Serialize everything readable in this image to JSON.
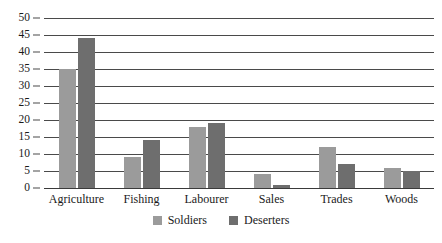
{
  "chart_data": {
    "type": "bar",
    "title": "",
    "subtitle": "",
    "xlabel": "",
    "ylabel": "",
    "categories": [
      "Agriculture",
      "Fishing",
      "Labourer",
      "Sales",
      "Trades",
      "Woods"
    ],
    "series": [
      {
        "name": "Soldiers",
        "color": "#9b9b9b",
        "values": [
          35,
          9,
          18,
          4,
          12,
          6
        ]
      },
      {
        "name": "Deserters",
        "color": "#6e6e6e",
        "values": [
          44,
          14,
          19,
          1,
          7,
          5
        ]
      }
    ],
    "ylim": [
      0,
      50
    ],
    "ytick_step": 5,
    "yticks": [
      "0",
      "5",
      "10",
      "15",
      "20",
      "25",
      "30",
      "35",
      "40",
      "45",
      "50"
    ],
    "grid": true,
    "grid_axis": "y",
    "legend_position": "bottom-center"
  },
  "colors": {
    "background": "#ffffff",
    "grid": "#4a4a4a",
    "axis": "#3a3a3a",
    "text": "#1a1a1a"
  }
}
